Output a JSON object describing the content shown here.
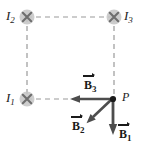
{
  "figure": {
    "type": "physics-diagram",
    "background_color": "#ffffff",
    "wire_marker_color": "#b3b3b3",
    "wire_cross_color": "#808080",
    "dashed_line_color": "#9a9a9a",
    "vector_color": "#4d4d4d",
    "point_color": "#1a1a1a",
    "text_color": "#1a1a1a"
  },
  "wires": [
    {
      "id": "I2",
      "label": "I",
      "subscript": "2",
      "marker": "cross-in-circle-icon",
      "direction": "into-page",
      "x": 27,
      "y": 17,
      "label_x": 6,
      "label_y": 10
    },
    {
      "id": "I3",
      "label": "I",
      "subscript": "3",
      "marker": "cross-in-circle-icon",
      "direction": "into-page",
      "x": 114,
      "y": 17,
      "label_x": 124,
      "label_y": 10
    },
    {
      "id": "I1",
      "label": "I",
      "subscript": "1",
      "marker": "cross-in-circle-icon",
      "direction": "into-page",
      "x": 27,
      "y": 99,
      "label_x": 6,
      "label_y": 92
    }
  ],
  "point": {
    "id": "P",
    "label": "P",
    "x": 113,
    "y": 99,
    "label_x": 122,
    "label_y": 92
  },
  "dashed_lines": [
    {
      "name": "top-edge",
      "x1": 27,
      "y1": 17,
      "x2": 114,
      "y2": 17
    },
    {
      "name": "left-edge",
      "x1": 27,
      "y1": 17,
      "x2": 27,
      "y2": 99
    },
    {
      "name": "right-edge",
      "x1": 114,
      "y1": 17,
      "x2": 114,
      "y2": 99
    },
    {
      "name": "bottom-edge",
      "x1": 27,
      "y1": 99,
      "x2": 113,
      "y2": 99
    }
  ],
  "vectors": [
    {
      "id": "B3",
      "label": "B",
      "subscript": "3",
      "notation": "vector-arrow-over",
      "from_x": 112,
      "from_y": 99,
      "to_x": 72,
      "to_y": 99,
      "direction": "left",
      "label_x": 84,
      "label_y": 80
    },
    {
      "id": "B2",
      "label": "B",
      "subscript": "2",
      "notation": "vector-arrow-over",
      "from_x": 112,
      "from_y": 99,
      "to_x": 88,
      "to_y": 121,
      "direction": "down-left-diagonal",
      "label_x": 72,
      "label_y": 120
    },
    {
      "id": "B1",
      "label": "B",
      "subscript": "1",
      "notation": "vector-arrow-over",
      "from_x": 113,
      "from_y": 99,
      "to_x": 113,
      "to_y": 133,
      "direction": "down",
      "label_x": 118,
      "label_y": 128
    }
  ]
}
